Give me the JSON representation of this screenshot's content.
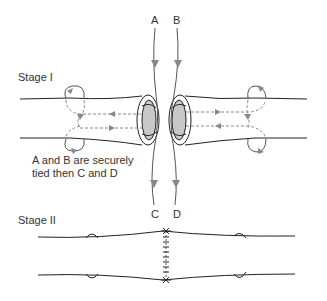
{
  "stage1": {
    "label": "Stage I",
    "suture_labels": {
      "a": "A",
      "b": "B",
      "c": "C",
      "d": "D"
    },
    "note_line1": "A and B are securely",
    "note_line2": "tied then C and D"
  },
  "stage2": {
    "label": "Stage II"
  },
  "colors": {
    "vessel": "#222222",
    "suture_path": "#888888",
    "lumen": "#c8c8c8"
  }
}
